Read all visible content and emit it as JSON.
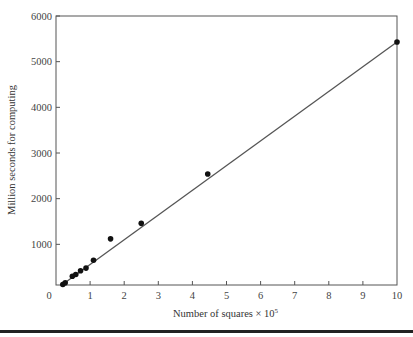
{
  "chart_data": {
    "type": "scatter",
    "title": "",
    "xlabel": "Number of squares × 10",
    "xlabel_sup": "5",
    "ylabel": "Million seconds for computing",
    "xlim": [
      0,
      10
    ],
    "ylim": [
      0,
      6000
    ],
    "x_ticks": [
      0,
      1,
      2,
      3,
      4,
      5,
      6,
      7,
      8,
      9,
      10
    ],
    "y_ticks": [
      1000,
      2000,
      3000,
      4000,
      5000,
      6000
    ],
    "grid": false,
    "legend": null,
    "series": [
      {
        "name": "observed",
        "kind": "scatter",
        "points": [
          {
            "x": 0.2,
            "y": 120
          },
          {
            "x": 0.27,
            "y": 160
          },
          {
            "x": 0.48,
            "y": 300
          },
          {
            "x": 0.58,
            "y": 340
          },
          {
            "x": 0.72,
            "y": 420
          },
          {
            "x": 0.88,
            "y": 480
          },
          {
            "x": 1.1,
            "y": 650
          },
          {
            "x": 1.6,
            "y": 1120
          },
          {
            "x": 2.5,
            "y": 1460
          },
          {
            "x": 4.45,
            "y": 2540
          },
          {
            "x": 10.0,
            "y": 5430
          }
        ]
      },
      {
        "name": "linear fit",
        "kind": "line",
        "points": [
          {
            "x": 0.15,
            "y": 100
          },
          {
            "x": 10.0,
            "y": 5430
          }
        ]
      }
    ]
  },
  "colors": {
    "line": "#555555",
    "points": "#111111",
    "axis": "#555555",
    "rule": "#222222"
  }
}
